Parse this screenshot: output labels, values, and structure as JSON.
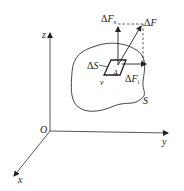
{
  "diagram": {
    "type": "stress-vector-on-surface",
    "axes": {
      "origin_label": "O",
      "x_label": "x",
      "y_label": "y",
      "z_label": "z"
    },
    "body": {
      "surface_label": "S",
      "point_label": "A",
      "normal_label": "ν",
      "element_label": "ΔS"
    },
    "forces": {
      "resultant": {
        "delta": "Δ",
        "symbol": "F",
        "sub": ""
      },
      "normal": {
        "delta": "Δ",
        "symbol": "F",
        "sub": "n"
      },
      "tangential": {
        "delta": "Δ",
        "symbol": "F",
        "sub": "t"
      }
    },
    "colors": {
      "stroke": "#222222",
      "background": "#ffffff"
    }
  }
}
